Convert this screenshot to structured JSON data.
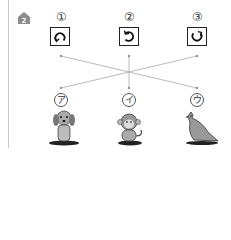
{
  "question": {
    "number_icon": "house-2-icon",
    "number": "2"
  },
  "rotations": [
    {
      "label": "①",
      "icon": "rotate-icon-counterclockwise-full"
    },
    {
      "label": "②",
      "icon": "rotate-icon-counterclockwise-three-quarter"
    },
    {
      "label": "③",
      "icon": "rotate-icon-clockwise-three-quarter"
    }
  ],
  "animals": [
    {
      "label": "ア",
      "name": "dog"
    },
    {
      "label": "イ",
      "name": "monkey"
    },
    {
      "label": "ウ",
      "name": "bird"
    }
  ],
  "connections": [
    {
      "from": "①",
      "to": "ウ"
    },
    {
      "from": "②",
      "to": "イ"
    },
    {
      "from": "③",
      "to": "ア"
    }
  ],
  "colors": {
    "line": "#aaaaaa",
    "icon": "#8c8c8c"
  }
}
